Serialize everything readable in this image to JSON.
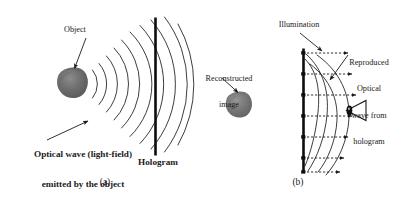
{
  "figure": {
    "width": 407,
    "height": 201,
    "background_color": "#ffffff",
    "ink_color": "#1a1a1a",
    "object_fill_color": "#6e6e6e"
  },
  "panel_a": {
    "caption": "(a)",
    "labels": {
      "object": "Object",
      "optical_wave_line1": "Optical wave (light-field)",
      "optical_wave_line2": "emitted by the object",
      "hologram": "Hologram"
    },
    "elements": {
      "object_blob": "object-blob",
      "hologram_plate": "hologram-plate",
      "wavefronts": "spherical-wavefront-arcs",
      "pointer_object": "object-pointer-arrow",
      "pointer_wave": "optical-wave-pointer-arrow"
    }
  },
  "panel_b": {
    "caption": "(b)",
    "labels": {
      "illumination": "Illumination",
      "reconstructed_line1": "Reconstructed",
      "reconstructed_line2": "image",
      "reproduced_line1": "Reproduced",
      "reproduced_line2": "Optical",
      "reproduced_line3": "wave from",
      "reproduced_line4": "hologram"
    },
    "elements": {
      "reconstructed_blob": "reconstructed-image-blob",
      "hologram_plate": "hologram-plate",
      "illumination_rays": "illumination-dashed-arrows",
      "wavefronts": "reproduced-wavefront-arcs",
      "eye": "observer-eye-icon",
      "pointer_illumination": "illumination-pointer-arrow",
      "pointer_reproduced": "reproduced-wave-pointer-arrow",
      "pointer_reconstructed": "reconstructed-image-pointer-arrow"
    }
  }
}
